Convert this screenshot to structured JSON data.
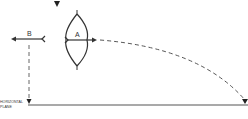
{
  "diagram": {
    "labels": {
      "arrow_a": "A",
      "arrow_b": "B",
      "plane_line1": "HORIZONTAL",
      "plane_line2": "PLANE"
    },
    "colors": {
      "stroke": "#333333",
      "dash": "#555555",
      "ground": "#555555",
      "background": "#ffffff"
    }
  }
}
